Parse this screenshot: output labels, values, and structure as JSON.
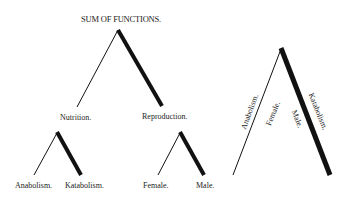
{
  "diagram": {
    "title": "SUM OF FUNCTIONS.",
    "level1": [
      "Nutrition.",
      "Reproduction."
    ],
    "nutrition_children": [
      "Anabolism.",
      "Katabolism."
    ],
    "reproduction_children": [
      "Female.",
      "Male."
    ],
    "combined_figure": {
      "thin_side_labels": [
        "Anabolism.",
        "Female."
      ],
      "thick_side_labels": [
        "Male.",
        "Katabolism."
      ]
    },
    "colors": {
      "line": "#111111",
      "background": "#ffffff"
    }
  }
}
